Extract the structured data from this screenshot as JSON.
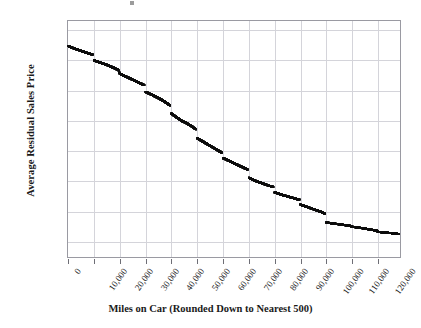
{
  "chart_data": {
    "type": "scatter",
    "title": "",
    "xlabel": "Miles on Car (Rounded Down to Nearest 500)",
    "ylabel": "Average Residual Sales Price",
    "xlim": [
      0,
      128500
    ],
    "ylim": [
      6500,
      14300
    ],
    "xticks": [
      0,
      10000,
      20000,
      30000,
      40000,
      50000,
      60000,
      70000,
      80000,
      90000,
      100000,
      110000,
      120000
    ],
    "xtick_labels": [
      "0",
      "10,000",
      "20,000",
      "30,000",
      "40,000",
      "50,000",
      "60,000",
      "70,000",
      "80,000",
      "90,000",
      "100,000",
      "110,000",
      "120,000"
    ],
    "yticks": [
      7000,
      8000,
      9000,
      10000,
      11000,
      12000,
      13000,
      14000
    ],
    "ytick_labels": [
      "7,000",
      "8,000",
      "9,000",
      "10,000",
      "11,000",
      "12,000",
      "13,000",
      "14,000"
    ],
    "y_minor_tick_step": 250,
    "grid": true,
    "grid_color": "#d4d4da",
    "marker_color": "#0c0c0c",
    "marker_size": 2.6,
    "series_name": "Average residual sales price by mileage",
    "x": [
      0,
      500,
      1000,
      1500,
      2000,
      2500,
      3000,
      3500,
      4000,
      4500,
      5000,
      5500,
      6000,
      6500,
      7000,
      7500,
      8000,
      8500,
      9000,
      9500,
      10000,
      10500,
      11000,
      11500,
      12000,
      12500,
      13000,
      13500,
      14000,
      14500,
      15000,
      15500,
      16000,
      16500,
      17000,
      17500,
      18000,
      18500,
      19000,
      19500,
      20000,
      20500,
      21000,
      21500,
      22000,
      22500,
      23000,
      23500,
      24000,
      24500,
      25000,
      25500,
      26000,
      26500,
      27000,
      27500,
      28000,
      28500,
      29000,
      29500,
      30000,
      30500,
      31000,
      31500,
      32000,
      32500,
      33000,
      33500,
      34000,
      34500,
      35000,
      35500,
      36000,
      36500,
      37000,
      37500,
      38000,
      38500,
      39000,
      39500,
      40000,
      40500,
      41000,
      41500,
      42000,
      42500,
      43000,
      43500,
      44000,
      44500,
      45000,
      45500,
      46000,
      46500,
      47000,
      47500,
      48000,
      48500,
      49000,
      49500,
      50000,
      50500,
      51000,
      51500,
      52000,
      52500,
      53000,
      53500,
      54000,
      54500,
      55000,
      55500,
      56000,
      56500,
      57000,
      57500,
      58000,
      58500,
      59000,
      59500,
      60000,
      60500,
      61000,
      61500,
      62000,
      62500,
      63000,
      63500,
      64000,
      64500,
      65000,
      65500,
      66000,
      66500,
      67000,
      67500,
      68000,
      68500,
      69000,
      69500,
      70000,
      70500,
      71000,
      71500,
      72000,
      72500,
      73000,
      73500,
      74000,
      74500,
      75000,
      75500,
      76000,
      76500,
      77000,
      77500,
      78000,
      78500,
      79000,
      79500,
      80000,
      80500,
      81000,
      81500,
      82000,
      82500,
      83000,
      83500,
      84000,
      84500,
      85000,
      85500,
      86000,
      86500,
      87000,
      87500,
      88000,
      88500,
      89000,
      89500,
      90000,
      90500,
      91000,
      91500,
      92000,
      92500,
      93000,
      93500,
      94000,
      94500,
      95000,
      95500,
      96000,
      96500,
      97000,
      97500,
      98000,
      98500,
      99000,
      99500,
      100000,
      100500,
      101000,
      101500,
      102000,
      102500,
      103000,
      103500,
      104000,
      104500,
      105000,
      105500,
      106000,
      106500,
      107000,
      107500,
      108000,
      108500,
      109000,
      109500,
      110000,
      110500,
      111000,
      111500,
      112000,
      112500,
      113000,
      113500,
      114000,
      114500,
      115000,
      115500,
      116000,
      116500,
      117000,
      117500,
      118000,
      118500,
      119000,
      119500,
      120000,
      120500,
      121000,
      121500,
      122000,
      122500,
      123000,
      123500,
      124000,
      124500,
      125000,
      125500,
      126000,
      126500,
      127000,
      127500,
      128000
    ],
    "y": [
      13480,
      13460,
      13440,
      13420,
      13405,
      13390,
      13375,
      13360,
      13345,
      13330,
      13315,
      13300,
      13285,
      13270,
      13255,
      13240,
      13228,
      13216,
      13204,
      13192,
      13000,
      12985,
      12970,
      12955,
      12940,
      12925,
      12910,
      12895,
      12880,
      12865,
      12850,
      12832,
      12814,
      12796,
      12778,
      12760,
      12740,
      12720,
      12700,
      12680,
      12560,
      12540,
      12520,
      12500,
      12480,
      12460,
      12440,
      12420,
      12400,
      12380,
      12360,
      12340,
      12320,
      12300,
      12280,
      12260,
      12240,
      12220,
      12200,
      12180,
      11960,
      11940,
      11920,
      11900,
      11880,
      11860,
      11840,
      11818,
      11796,
      11774,
      11752,
      11730,
      11705,
      11680,
      11655,
      11630,
      11600,
      11570,
      11540,
      11510,
      11240,
      11210,
      11180,
      11150,
      11120,
      11090,
      11060,
      11030,
      11000,
      10980,
      10960,
      10940,
      10915,
      10890,
      10865,
      10840,
      10810,
      10780,
      10750,
      10720,
      10430,
      10400,
      10375,
      10350,
      10325,
      10300,
      10275,
      10250,
      10225,
      10200,
      10175,
      10150,
      10125,
      10100,
      10075,
      10050,
      10025,
      10000,
      9975,
      9950,
      9770,
      9750,
      9730,
      9710,
      9690,
      9670,
      9650,
      9630,
      9610,
      9590,
      9570,
      9550,
      9530,
      9510,
      9490,
      9470,
      9450,
      9430,
      9410,
      9390,
      9120,
      9100,
      9080,
      9060,
      9040,
      9020,
      9000,
      8985,
      8970,
      8955,
      8940,
      8925,
      8910,
      8895,
      8880,
      8865,
      8850,
      8838,
      8826,
      8814,
      8640,
      8625,
      8610,
      8595,
      8580,
      8565,
      8550,
      8538,
      8526,
      8514,
      8502,
      8490,
      8478,
      8466,
      8454,
      8442,
      8430,
      8418,
      8406,
      8394,
      8230,
      8215,
      8200,
      8185,
      8170,
      8155,
      8140,
      8125,
      8110,
      8095,
      8080,
      8065,
      8050,
      8035,
      8020,
      8005,
      7990,
      7970,
      7950,
      7920,
      7640,
      7634,
      7628,
      7622,
      7616,
      7610,
      7604,
      7598,
      7592,
      7586,
      7580,
      7574,
      7568,
      7562,
      7556,
      7550,
      7544,
      7538,
      7532,
      7526,
      7500,
      7494,
      7488,
      7482,
      7476,
      7470,
      7464,
      7458,
      7452,
      7446,
      7440,
      7432,
      7424,
      7416,
      7408,
      7400,
      7392,
      7384,
      7376,
      7368,
      7330,
      7326,
      7322,
      7318,
      7314,
      7310,
      7306,
      7302,
      7298,
      7294,
      7290,
      7285,
      7280,
      7275,
      7270,
      7265,
      7260
    ]
  }
}
